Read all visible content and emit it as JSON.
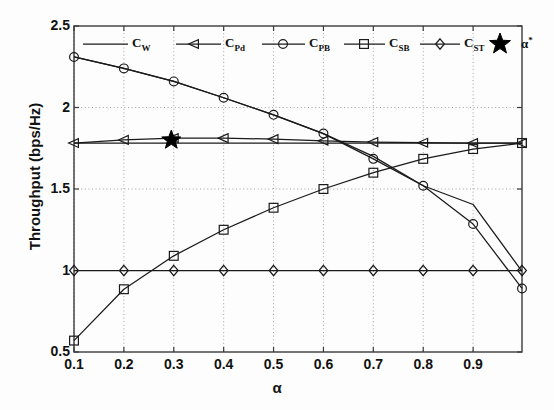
{
  "chart_data": {
    "type": "line",
    "title": "",
    "xlabel": "α",
    "ylabel": "Throughput (bps/Hz)",
    "xlim": [
      0.1,
      0.998
    ],
    "ylim": [
      0.5,
      2.5
    ],
    "xticks": [
      "0.1",
      "0.2",
      "0.3",
      "0.4",
      "0.5",
      "0.6",
      "0.7",
      "0.8",
      "0.9"
    ],
    "xtick_values": [
      0.1,
      0.2,
      0.3,
      0.4,
      0.5,
      0.6,
      0.7,
      0.8,
      0.9
    ],
    "yticks": [
      "0.5",
      "1",
      "1.5",
      "2",
      "2.5"
    ],
    "ytick_values": [
      0.5,
      1.0,
      1.5,
      2.0,
      2.5
    ],
    "grid": true,
    "grid_style": "dotted",
    "legend_position": "top-inside",
    "line_color": "#1a1a1a",
    "x": [
      0.1,
      0.2,
      0.3,
      0.4,
      0.5,
      0.6,
      0.7,
      0.8,
      0.9,
      0.998
    ],
    "series": [
      {
        "name": "C_W",
        "label": "C",
        "sub": "W",
        "marker": "none",
        "values": [
          1.782,
          1.782,
          1.782,
          1.782,
          1.782,
          1.782,
          1.782,
          1.782,
          1.782,
          1.782
        ]
      },
      {
        "name": "C_Pd",
        "label": "C",
        "sub": "Pd",
        "marker": "triangle-left",
        "values": [
          1.782,
          1.801,
          1.812,
          1.812,
          1.806,
          1.796,
          1.788,
          1.784,
          1.782,
          1.782
        ]
      },
      {
        "name": "C_PB",
        "label": "C",
        "sub": "PB",
        "marker": "circle",
        "values": [
          2.31,
          2.24,
          2.16,
          2.06,
          1.955,
          1.84,
          1.685,
          1.52,
          1.285,
          0.89
        ]
      },
      {
        "name": "C_SB",
        "label": "C",
        "sub": "SB",
        "marker": "square",
        "values": [
          0.57,
          0.885,
          1.09,
          1.25,
          1.385,
          1.5,
          1.6,
          1.685,
          1.745,
          1.782
        ]
      },
      {
        "name": "C_ST",
        "label": "C",
        "sub": "ST",
        "marker": "diamond",
        "values": [
          1.0,
          1.0,
          1.0,
          1.0,
          1.0,
          1.0,
          1.0,
          1.0,
          1.0,
          1.0
        ]
      },
      {
        "name": "C_extra",
        "label": "",
        "sub": "",
        "marker": "none",
        "values": [
          2.31,
          2.24,
          2.16,
          2.06,
          1.955,
          1.84,
          1.7,
          1.52,
          1.405,
          0.995
        ]
      }
    ],
    "annotations": [
      {
        "name": "alpha-star",
        "marker": "star",
        "label": "α",
        "sup": "*",
        "x": 0.295,
        "y": 1.8
      }
    ],
    "legend": [
      {
        "name": "C_W",
        "label": "C",
        "sub": "W",
        "marker": "none"
      },
      {
        "name": "C_Pd",
        "label": "C",
        "sub": "Pd",
        "marker": "triangle-left"
      },
      {
        "name": "C_PB",
        "label": "C",
        "sub": "PB",
        "marker": "circle"
      },
      {
        "name": "C_SB",
        "label": "C",
        "sub": "SB",
        "marker": "square"
      },
      {
        "name": "C_ST",
        "label": "C",
        "sub": "ST",
        "marker": "diamond"
      },
      {
        "name": "alpha-star",
        "label": "α",
        "sup": "*",
        "marker": "star"
      }
    ]
  }
}
